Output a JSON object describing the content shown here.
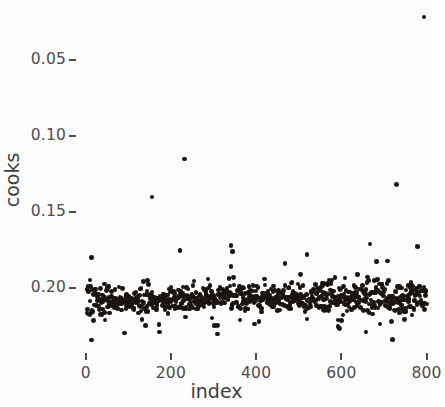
{
  "chart_data": {
    "type": "scatter",
    "title": "",
    "xlabel": "index",
    "ylabel": "cooks",
    "xlim": [
      -18,
      815
    ],
    "ylim": [
      0.008,
      0.234
    ],
    "grid": false,
    "legend": null,
    "point_color": "#1a1410",
    "point_size_px": 4.6,
    "n_points": 795,
    "xticks": [
      0,
      200,
      400,
      600,
      800
    ],
    "xtick_labels": [
      "0",
      "200",
      "400",
      "600",
      "800"
    ],
    "yticks": [
      0.05,
      0.1,
      0.15,
      0.2
    ],
    "ytick_labels": [
      "0.05",
      "0.10",
      "0.15",
      "0.20"
    ],
    "series": [
      {
        "name": "cooks",
        "kind": "bulk_band",
        "n": 780,
        "band_center_start": 0.0415,
        "band_center_end": 0.0435,
        "band_core_sd": 0.0042,
        "band_tail_fraction": 0.16,
        "band_tail_sd": 0.0105,
        "bulk_min": 0.016,
        "bulk_max": 0.079,
        "x_from": 2,
        "x_to": 800
      },
      {
        "name": "outliers",
        "kind": "points",
        "points": [
          {
            "index": 155,
            "cooks": 0.11
          },
          {
            "index": 232,
            "cooks": 0.135
          },
          {
            "index": 341,
            "cooks": 0.078
          },
          {
            "index": 344,
            "cooks": 0.074
          },
          {
            "index": 730,
            "cooks": 0.118
          },
          {
            "index": 793,
            "cooks": 0.228
          }
        ]
      }
    ],
    "axis_text_color": "#4c4c4c",
    "axis_title_color": "#3d3d3d",
    "background_color": "#fdfdfd"
  },
  "axes": {
    "y_title": "cooks",
    "x_title": "index",
    "y_ticks": [
      {
        "label": "0.20",
        "value": 0.2
      },
      {
        "label": "0.15",
        "value": 0.15
      },
      {
        "label": "0.10",
        "value": 0.1
      },
      {
        "label": "0.05",
        "value": 0.05
      }
    ],
    "x_ticks": [
      {
        "label": "0",
        "value": 0
      },
      {
        "label": "200",
        "value": 200
      },
      {
        "label": "400",
        "value": 400
      },
      {
        "label": "600",
        "value": 600
      },
      {
        "label": "800",
        "value": 800
      }
    ]
  }
}
